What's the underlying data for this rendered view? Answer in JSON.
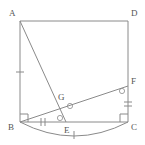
{
  "figure": {
    "stroke_color": "#8a8a8a",
    "label_color": "#555555",
    "background_color": "#ffffff",
    "stroke_width": 1,
    "points": {
      "A": {
        "x": 20,
        "y": 21,
        "label": "A",
        "label_x": 9,
        "label_y": 16
      },
      "D": {
        "x": 128,
        "y": 21,
        "label": "D",
        "label_x": 131,
        "label_y": 16
      },
      "B": {
        "x": 20,
        "y": 122,
        "label": "B",
        "label_x": 8,
        "label_y": 130
      },
      "C": {
        "x": 128,
        "y": 122,
        "label": "C",
        "label_x": 131,
        "label_y": 130
      },
      "E": {
        "x": 66,
        "y": 122,
        "label": "E",
        "label_x": 64,
        "label_y": 133
      },
      "F": {
        "x": 128,
        "y": 86,
        "label": "F",
        "label_x": 131,
        "label_y": 84
      },
      "G": {
        "x": 67,
        "y": 103,
        "label": "G",
        "label_x": 58,
        "label_y": 100
      }
    },
    "segments": [
      {
        "name": "side-AD",
        "from": "A",
        "to": "D"
      },
      {
        "name": "side-AB",
        "from": "A",
        "to": "B"
      },
      {
        "name": "side-DC",
        "from": "D",
        "to": "C"
      },
      {
        "name": "side-BC",
        "from": "B",
        "to": "C"
      },
      {
        "name": "segment-AE",
        "from": "A",
        "to": "E"
      },
      {
        "name": "segment-BF",
        "from": "B",
        "to": "F"
      }
    ],
    "arc": {
      "name": "arc-BC",
      "from": "B",
      "to": "C",
      "sag": 17,
      "description": "arc bulging below side BC"
    },
    "right_angle_marks": [
      {
        "name": "right-angle-at-B",
        "at": "B",
        "size": 8
      },
      {
        "name": "right-angle-at-C",
        "at": "C",
        "size": 8
      }
    ],
    "angle_marks": [
      {
        "name": "angle-mark-at-E",
        "x": 60,
        "y": 118,
        "radius": 2.6
      },
      {
        "name": "angle-mark-at-G",
        "x": 70,
        "y": 106,
        "radius": 2.6
      },
      {
        "name": "angle-mark-at-F",
        "x": 122,
        "y": 91,
        "radius": 2.6
      }
    ],
    "tick_marks": [
      {
        "name": "tick-on-AB",
        "count": 1,
        "x": 20,
        "y": 72,
        "orientation": "horizontal",
        "length": 8
      },
      {
        "name": "tick-on-BE",
        "count": 2,
        "x": 43,
        "y": 122,
        "orientation": "vertical",
        "length": 8
      },
      {
        "name": "tick-on-FC",
        "count": 2,
        "x": 128,
        "y": 104,
        "orientation": "horizontal",
        "length": 8
      },
      {
        "name": "tick-on-arc",
        "count": 1,
        "x": 74,
        "y": 135,
        "orientation": "vertical",
        "length": 8
      }
    ]
  }
}
